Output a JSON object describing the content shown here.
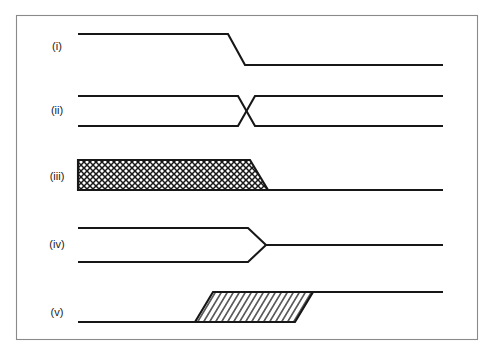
{
  "figure": {
    "background_color": "#ffffff",
    "line_color": "#171717",
    "frame_color": "#8a8a8a",
    "width": 496,
    "height": 355,
    "frame": {
      "x": 16,
      "y": 15,
      "width": 462,
      "height": 325
    }
  },
  "labels": {
    "row1": "(i)",
    "row2": "(ii)",
    "row3": "(iii)",
    "row4": "(iv)",
    "row5": "(v)"
  },
  "rows": [
    {
      "id": "row-i",
      "label": "(i)",
      "label_x": 57,
      "label_y": 47,
      "description": "single line stepping down",
      "geometry": {
        "polyline": "78,34 228,34 245,65 443,65"
      }
    },
    {
      "id": "row-ii",
      "label": "(ii)",
      "label_x": 57,
      "label_y": 111,
      "description": "two parallel lines crossing in an X",
      "geometry": {
        "upper": "78,96 238,96 255,126 443,126",
        "lower": "78,126 238,126 255,96 443,96"
      }
    },
    {
      "id": "row-iii",
      "label": "(iii)",
      "label_x": 57,
      "label_y": 177,
      "description": "cross-hatched parallelogram tapering to a single line",
      "geometry": {
        "outline": "78,160 250,160 268,190 443,190 78,190",
        "hatch_pattern": "crosshatch",
        "hatch_spacing": 5,
        "single_line": "268,190 443,190"
      }
    },
    {
      "id": "row-iv",
      "label": "(iv)",
      "label_x": 57,
      "label_y": 245,
      "description": "two parallel lines converging to a point then one line",
      "geometry": {
        "upper": "78,228 248,228 266,245 443,245",
        "lower": "78,262 248,262 266,245"
      }
    },
    {
      "id": "row-v",
      "label": "(v)",
      "label_x": 57,
      "label_y": 313,
      "description": "diagonally hatched parallelogram stepping the line upward",
      "geometry": {
        "outline": "195,322 213,292 313,292 295,322",
        "hatch_pattern": "diagonal",
        "hatch_spacing": 5,
        "left_line": "78,322 195,322",
        "right_line": "313,292 443,292"
      }
    }
  ]
}
